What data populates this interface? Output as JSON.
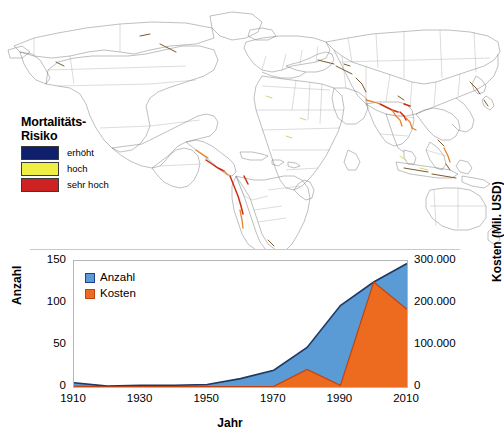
{
  "map": {
    "legend": {
      "title_line1": "Mortalitäts-",
      "title_line2": "Risiko",
      "items": [
        {
          "label": "erhöht",
          "color": "#101f6b"
        },
        {
          "label": "hoch",
          "color": "#eeee44"
        },
        {
          "label": "sehr hoch",
          "color": "#cc2222"
        }
      ]
    }
  },
  "chart_data": {
    "type": "area",
    "title": "",
    "xlabel": "Jahr",
    "ylabel": "Anzahl",
    "y2label": "Kosten (Mil. USD)",
    "x": [
      1910,
      1920,
      1930,
      1940,
      1950,
      1960,
      1970,
      1980,
      1990,
      2000,
      2010
    ],
    "xticks": [
      "1910",
      "1930",
      "1950",
      "1970",
      "1990",
      "2010"
    ],
    "xlim": [
      1910,
      2010
    ],
    "ylim": [
      0,
      150
    ],
    "yticks": [
      "0",
      "50",
      "100",
      "150"
    ],
    "y2lim": [
      0,
      300000
    ],
    "y2ticks": [
      "0",
      "100.000",
      "200.000",
      "300.000"
    ],
    "grid": false,
    "legend_position": "top-left",
    "series": [
      {
        "name": "Anzahl",
        "axis": "left",
        "color": "#5b9bd5",
        "line_color": "#1f3864",
        "values": [
          5,
          1,
          2,
          2,
          3,
          10,
          20,
          47,
          97,
          125,
          147
        ]
      },
      {
        "name": "Kosten",
        "axis": "right",
        "color": "#ec6b1f",
        "line_color": "#c1440e",
        "values": [
          2000,
          500,
          1000,
          800,
          1200,
          1000,
          1500,
          42000,
          4000,
          250000,
          185000
        ]
      }
    ]
  }
}
